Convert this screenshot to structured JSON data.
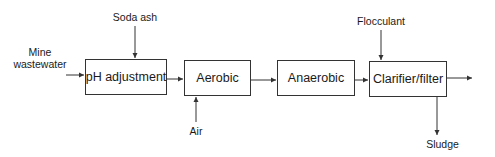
{
  "diagram": {
    "type": "process-flow",
    "nodes": [
      {
        "id": "ph",
        "label": "pH adjustment"
      },
      {
        "id": "aerobic",
        "label": "Aerobic"
      },
      {
        "id": "anaerobic",
        "label": "Anaerobic"
      },
      {
        "id": "clarifier",
        "label": "Clarifier/filter"
      }
    ],
    "inputs": {
      "mine_wastewater": {
        "line1": "Mine",
        "line2": "wastewater"
      },
      "soda_ash": "Soda ash",
      "air": "Air",
      "flocculant": "Flocculant"
    },
    "outputs": {
      "sludge": "Sludge"
    },
    "edges": [
      {
        "from": "Mine wastewater",
        "to": "pH adjustment"
      },
      {
        "from": "Soda ash",
        "to": "pH adjustment"
      },
      {
        "from": "pH adjustment",
        "to": "Aerobic"
      },
      {
        "from": "Air",
        "to": "Aerobic"
      },
      {
        "from": "Aerobic",
        "to": "Anaerobic"
      },
      {
        "from": "Anaerobic",
        "to": "Clarifier/filter"
      },
      {
        "from": "Flocculant",
        "to": "Clarifier/filter"
      },
      {
        "from": "Clarifier/filter",
        "to": "Sludge"
      },
      {
        "from": "Clarifier/filter",
        "to": "effluent"
      }
    ],
    "colors": {
      "line": "#333333",
      "text": "#1a1a1a",
      "background": "#ffffff"
    }
  }
}
